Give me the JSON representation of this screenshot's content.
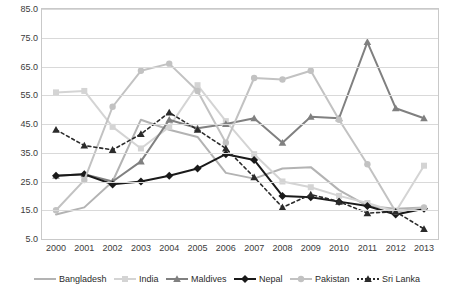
{
  "chart_data": {
    "type": "line",
    "title": "",
    "xlabel": "",
    "ylabel": "",
    "ylim": [
      5.0,
      85.0
    ],
    "ytick_labels": [
      "5.0",
      "15.0",
      "25.0",
      "35.0",
      "45.0",
      "55.0",
      "65.0",
      "75.0",
      "85.0"
    ],
    "ytick_values": [
      5,
      15,
      25,
      35,
      45,
      55,
      65,
      75,
      85
    ],
    "grid": true,
    "legend_position": "bottom",
    "categories": [
      "2000",
      "2001",
      "2002",
      "2003",
      "2004",
      "2005",
      "2006",
      "2007",
      "2008",
      "2009",
      "2010",
      "2011",
      "2012",
      "2013"
    ],
    "series": [
      {
        "name": "Bangladesh",
        "color": "#b3b3b3",
        "marker": "none",
        "values": [
          13.5,
          16.0,
          25.0,
          46.5,
          43.0,
          40.5,
          28.0,
          26.0,
          29.5,
          30.0,
          22.0,
          16.5,
          15.5,
          16.0
        ]
      },
      {
        "name": "India",
        "color": "#d4d4d4",
        "marker": "square",
        "values": [
          56.0,
          56.5,
          44.0,
          36.5,
          44.0,
          58.5,
          46.0,
          34.5,
          25.0,
          23.0,
          20.0,
          17.5,
          14.5,
          30.5
        ]
      },
      {
        "name": "Maldives",
        "color": "#808080",
        "marker": "triangle",
        "values": [
          27.0,
          27.5,
          25.0,
          32.0,
          46.5,
          43.5,
          45.0,
          47.0,
          38.5,
          47.5,
          47.0,
          73.5,
          50.5,
          47.0
        ]
      },
      {
        "name": "Nepal",
        "color": "#1a1a1a",
        "marker": "diamond",
        "values": [
          27.0,
          27.5,
          24.0,
          25.0,
          27.0,
          29.5,
          34.5,
          32.5,
          20.0,
          19.5,
          18.0,
          16.5,
          13.5,
          15.5
        ]
      },
      {
        "name": "Pakistan",
        "color": "#c2c2c2",
        "marker": "circle",
        "values": [
          15.0,
          25.5,
          51.0,
          63.5,
          66.0,
          56.5,
          38.5,
          61.0,
          60.5,
          63.5,
          46.5,
          31.0,
          14.5,
          16.0
        ]
      },
      {
        "name": "Sri Lanka",
        "color": "#2b2b2b",
        "marker": "triangle",
        "dashed": true,
        "values": [
          43.0,
          37.5,
          36.0,
          41.5,
          49.0,
          43.0,
          36.5,
          26.5,
          16.0,
          20.5,
          18.0,
          14.0,
          14.5,
          8.5
        ]
      }
    ]
  },
  "legend": {
    "items": [
      {
        "label": "Bangladesh"
      },
      {
        "label": "India"
      },
      {
        "label": "Maldives"
      },
      {
        "label": "Nepal"
      },
      {
        "label": "Pakistan"
      },
      {
        "label": "Sri Lanka"
      }
    ]
  }
}
